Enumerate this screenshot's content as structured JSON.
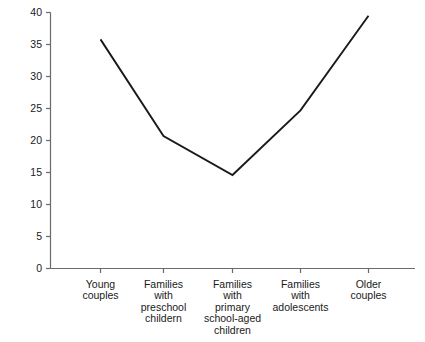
{
  "chart_data": {
    "type": "line",
    "title": "",
    "xlabel": "",
    "ylabel": "",
    "categories": [
      "Young couples",
      "Families with preschool childern",
      "Families with primary school-aged children",
      "Families with adolescents",
      "Older couples"
    ],
    "category_lines": [
      [
        "Young",
        "couples"
      ],
      [
        "Families",
        "with",
        "preschool",
        "childern"
      ],
      [
        "Families",
        "with",
        "primary",
        "school-aged",
        "children"
      ],
      [
        "Families",
        "with",
        "adolescents"
      ],
      [
        "Older",
        "couples"
      ]
    ],
    "values": [
      35.8,
      20.7,
      14.6,
      24.7,
      39.5
    ],
    "ylim": [
      0,
      40
    ],
    "yticks": [
      0,
      5,
      10,
      15,
      20,
      25,
      30,
      35,
      40
    ],
    "ytick_labels": [
      "0",
      "5",
      "10",
      "15",
      "20",
      "25",
      "30",
      "35",
      "40"
    ],
    "grid": false,
    "legend": null,
    "series": [
      {
        "name": "",
        "values": [
          35.8,
          20.7,
          14.6,
          24.7,
          39.5
        ],
        "color": "#1a1a1a"
      }
    ]
  },
  "style": {
    "line_color": "#1a1a1a",
    "axis_color": "#6b6b6b",
    "text_color": "#1a1a1a",
    "background": "#ffffff"
  }
}
